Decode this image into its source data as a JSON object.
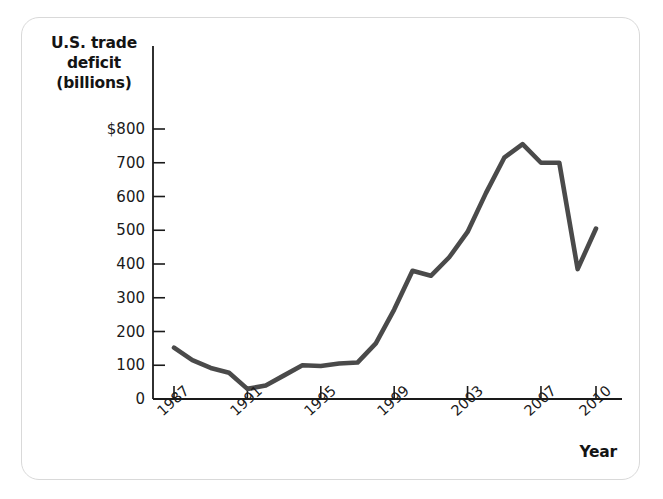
{
  "figure": {
    "background_color": "#ffffff",
    "border_color": "#d9d9d9",
    "line_color": "#4a4a4a",
    "axis_color": "#1a1a1a"
  },
  "axes": {
    "y_title_line1": "U.S. trade",
    "y_title_line2": "deficit",
    "y_title_line3": "(billions)",
    "x_title": "Year"
  },
  "chart_data": {
    "type": "line",
    "title": "",
    "xlabel": "Year",
    "ylabel": "U.S. trade deficit (billions)",
    "xlim": [
      1987,
      2010
    ],
    "ylim": [
      0,
      800
    ],
    "grid": false,
    "legend": null,
    "y_tick_labels": [
      "$800",
      "700",
      "600",
      "500",
      "400",
      "300",
      "200",
      "100",
      "0"
    ],
    "y_ticks": [
      800,
      700,
      600,
      500,
      400,
      300,
      200,
      100,
      0
    ],
    "x_tick_labels": [
      "1987",
      "1991",
      "1995",
      "1999",
      "2003",
      "2007",
      "2010"
    ],
    "x_ticks": [
      1987,
      1991,
      1995,
      1999,
      2003,
      2007,
      2010
    ],
    "series": [
      {
        "name": "U.S. trade deficit",
        "color": "#4a4a4a",
        "x": [
          1987,
          1988,
          1989,
          1990,
          1991,
          1992,
          1993,
          1994,
          1995,
          1996,
          1997,
          1998,
          1999,
          2000,
          2001,
          2002,
          2003,
          2004,
          2005,
          2006,
          2007,
          2008,
          2009,
          2010
        ],
        "values": [
          152,
          115,
          92,
          78,
          30,
          40,
          70,
          100,
          98,
          105,
          108,
          165,
          265,
          380,
          365,
          420,
          495,
          610,
          715,
          755,
          700,
          700,
          385,
          505
        ]
      }
    ]
  }
}
